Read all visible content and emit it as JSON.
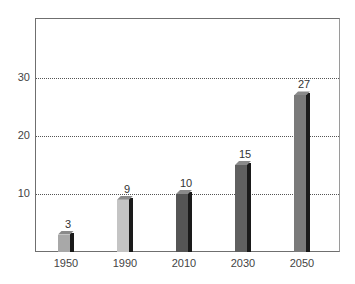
{
  "chart_data": {
    "type": "bar",
    "title": "",
    "xlabel": "",
    "ylabel": "",
    "categories": [
      "1950",
      "1990",
      "2010",
      "2030",
      "2050"
    ],
    "values": [
      3,
      9,
      10,
      15,
      27
    ],
    "data_labels": [
      "3",
      "9",
      "10",
      "15",
      "27"
    ],
    "ylim": [
      0,
      40
    ],
    "yticks": [
      "10",
      "20",
      "30"
    ],
    "grid": "horizontal dotted at 10, 20, 30",
    "legend": "none",
    "bar_colors": [
      "#a8a8a8",
      "#c4c4c4",
      "#555555",
      "#606060",
      "#7a7a7a"
    ]
  }
}
